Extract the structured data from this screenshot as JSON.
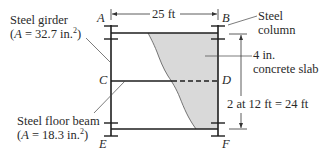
{
  "figure": {
    "type": "structural-frame-diagram",
    "points": {
      "A": "A",
      "B": "B",
      "C": "C",
      "D": "D",
      "E": "E",
      "F": "F"
    },
    "dimensions": {
      "span": "25 ft",
      "height": "2 at 12 ft = 24 ft"
    },
    "labels": {
      "girder": {
        "name": "Steel girder",
        "area_prefix": "(",
        "area_symbol": "A",
        "area_value": " = 32.7 in.",
        "area_exp": "2",
        "area_suffix": ")"
      },
      "floor_beam": {
        "name": "Steel floor beam",
        "area_prefix": "(",
        "area_symbol": "A",
        "area_value": " = 18.3 in.",
        "area_exp": "2",
        "area_suffix": ")"
      },
      "column": {
        "line1": "Steel",
        "line2": "column"
      },
      "slab": {
        "line1": "4 in.",
        "line2": "concrete slab"
      }
    },
    "colors": {
      "line": "#1e1e1e",
      "slab_fill": "#d9d9d9",
      "text": "#2a2a2a"
    }
  }
}
